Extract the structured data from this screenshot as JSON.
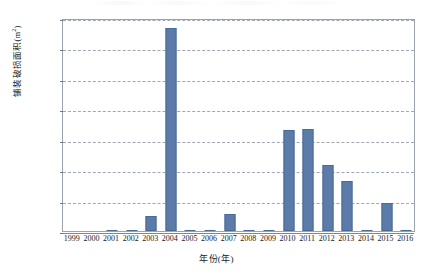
{
  "chart_data": {
    "type": "bar",
    "title": "",
    "xlabel": "年份(年)",
    "ylabel": "铺装破损面积(m²)",
    "ylabel_base": "铺装破损面积(m",
    "ylabel_sup": "2",
    "ylabel_tail": ")",
    "categories": [
      "1999",
      "2000",
      "2001",
      "2002",
      "2003",
      "2004",
      "2005",
      "2006",
      "2007",
      "2008",
      "2009",
      "2010",
      "2011",
      "2012",
      "2013",
      "2014",
      "2015",
      "2016"
    ],
    "values": [
      0,
      0,
      60,
      70,
      1450,
      20000,
      80,
      120,
      1650,
      130,
      50,
      10000,
      10100,
      6500,
      4900,
      100,
      2800,
      60
    ],
    "series": [
      {
        "name": "铺装破损面积",
        "values": [
          0,
          0,
          60,
          70,
          1450,
          20000,
          80,
          120,
          1650,
          130,
          50,
          10000,
          10100,
          6500,
          4900,
          100,
          2800,
          60
        ]
      }
    ],
    "ylim": [
      0,
      21000
    ],
    "yticks": [
      0,
      3000,
      6000,
      9000,
      12000,
      15000,
      18000,
      21000
    ],
    "ytick_labels": [
      "0",
      "3 000",
      "6 000",
      "9 000",
      "12 000",
      "15 000",
      "18 000",
      "21 000"
    ],
    "grid": true,
    "grid_style": "dashed-horizontal",
    "legend": "none",
    "bar_color": "#5b7ba8",
    "bar_border_color": "#4a6a97",
    "grid_color": "#8e98a6",
    "axis_color": "#9aa2ab",
    "text_color": "#1a1a1a"
  }
}
